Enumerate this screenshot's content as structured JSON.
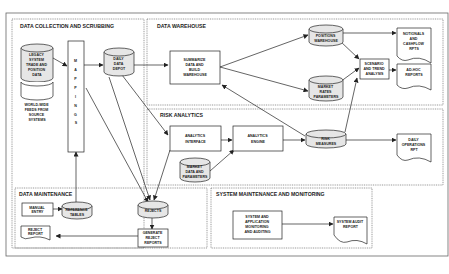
{
  "sections": {
    "collection": "DATA COLLECTION AND SCRUBBING",
    "warehouse": "DATA WAREHOUSE",
    "risk": "RISK ANALYTICS",
    "maintenance": "DATA MAINTENANCE",
    "system": "SYSTEM MAINTENANCE AND MONITORING"
  },
  "nodes": {
    "legacy": [
      "LEGACY",
      "SYSTEM",
      "TRADE AND",
      "POSITION",
      "DATA"
    ],
    "feeds": [
      "WORLD-WIDE",
      "FEEDS FROM",
      "SOURCE",
      "SYSTEMS"
    ],
    "mappings": [
      "M",
      "A",
      "P",
      "P",
      "I",
      "N",
      "G",
      "S"
    ],
    "depot": [
      "DAILY",
      "DATA",
      "DEPOT"
    ],
    "summarize": [
      "SUMMARIZE",
      "DATA AND",
      "BUILD",
      "WAREHOUSE"
    ],
    "positions": [
      "POSITIONS",
      "WAREHOUSE"
    ],
    "market_rates": [
      "MARKET",
      "RATES",
      "PARAMETERS"
    ],
    "scenario": [
      "SCENARIO",
      "AND TREND",
      "ANALYSIS"
    ],
    "notionals": [
      "NOTIONALS",
      "AND",
      "CASHFLOW",
      "RPTS"
    ],
    "adhoc": [
      "AD-HOC",
      "REPORTS"
    ],
    "analytics_interface": [
      "ANALYTICS",
      "INTERFACE"
    ],
    "analytics_engine": [
      "ANALYTICS",
      "ENGINE"
    ],
    "market_data": [
      "MARKET",
      "DATA AND",
      "PARAMETERS"
    ],
    "risk_measures": [
      "RISK",
      "MEASURES"
    ],
    "daily_ops": [
      "DAILY",
      "OPERATIONS",
      "RPT"
    ],
    "manual_entry": [
      "MANUAL",
      "ENTRY"
    ],
    "reference_tables": [
      "REFERENCE",
      "TABLES"
    ],
    "rejects": [
      "REJECTS"
    ],
    "reject_report": [
      "REJECT",
      "REPORT"
    ],
    "generate_rejects": [
      "GENERATE",
      "REJECT",
      "REPORTS"
    ],
    "sys_monitoring": [
      "SYSTEM AND",
      "APPLICATION",
      "MONITORING",
      "AND AUDITING"
    ],
    "sys_audit": [
      "SYSTEM AUDIT",
      "REPORT"
    ]
  }
}
